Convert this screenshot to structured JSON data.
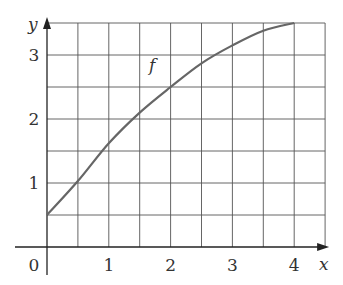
{
  "chart_data": {
    "type": "line",
    "title": "",
    "xlabel": "x",
    "ylabel": "y",
    "x_ticks": [
      "0",
      "1",
      "2",
      "3",
      "4"
    ],
    "y_ticks": [
      "1",
      "2",
      "3"
    ],
    "xlim": [
      0,
      4.5
    ],
    "ylim": [
      0,
      3.5
    ],
    "grid": true,
    "grid_step": 0.5,
    "legend": "none",
    "annotations": [
      {
        "text": "f",
        "x": 1.65,
        "y": 2.75
      }
    ],
    "series": [
      {
        "name": "f",
        "x": [
          0,
          0.5,
          1,
          1.5,
          2,
          2.5,
          3,
          3.5,
          4
        ],
        "values": [
          0.5,
          1.03,
          1.62,
          2.1,
          2.5,
          2.87,
          3.15,
          3.38,
          3.5
        ]
      }
    ]
  }
}
